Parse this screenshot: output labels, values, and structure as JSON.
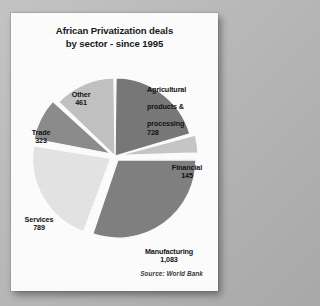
{
  "card": {
    "title_line1": "African Privatization deals",
    "title_line2": "by sector - since 1995",
    "source": "Source: World Bank"
  },
  "chart_data": {
    "type": "pie",
    "title": "African Privatization deals by sector - since 1995",
    "subtitle": "",
    "xlabel": "",
    "ylabel": "",
    "source": "Source: World Bank",
    "legend_position": "none",
    "labels_mode": "callout-with-value",
    "total": 3529,
    "units": "deals",
    "categories": [
      "Agricultural products & processing",
      "Financial",
      "Manufacturing",
      "Services",
      "Trade",
      "Other"
    ],
    "values": [
      728,
      145,
      1083,
      789,
      323,
      461
    ],
    "value_labels": [
      "728",
      "145",
      "1,083",
      "789",
      "323",
      "461"
    ],
    "slices": [
      {
        "name": "agricultural",
        "label_line1": "Agricultural",
        "label_line2": "products &",
        "label_line3": "processing",
        "value": 728,
        "value_label": "728",
        "percent": 20.6,
        "color": "#787878",
        "exploded": false
      },
      {
        "name": "financial",
        "label_line1": "Financial",
        "label_line2": "",
        "label_line3": "",
        "value": 145,
        "value_label": "145",
        "percent": 4.1,
        "color": "#c6c6c6",
        "exploded": true
      },
      {
        "name": "manufacturing",
        "label_line1": "Manufacturing",
        "label_line2": "",
        "label_line3": "",
        "value": 1083,
        "value_label": "1,083",
        "percent": 30.7,
        "color": "#808080",
        "exploded": true
      },
      {
        "name": "services",
        "label_line1": "Services",
        "label_line2": "",
        "label_line3": "",
        "value": 789,
        "value_label": "789",
        "percent": 22.4,
        "color": "#e4e4e4",
        "exploded": true
      },
      {
        "name": "trade",
        "label_line1": "Trade",
        "label_line2": "",
        "label_line3": "",
        "value": 323,
        "value_label": "323",
        "percent": 9.2,
        "color": "#8c8c8c",
        "exploded": true
      },
      {
        "name": "other",
        "label_line1": "Other",
        "label_line2": "",
        "label_line3": "",
        "value": 461,
        "value_label": "461",
        "percent": 13.1,
        "color": "#c2c2c2",
        "exploded": false
      }
    ],
    "geometry": {
      "cx": 104,
      "cy": 101,
      "radius": 78,
      "start_angle_deg": -90,
      "explode_offset": 5,
      "gap_deg": 1.6
    }
  }
}
